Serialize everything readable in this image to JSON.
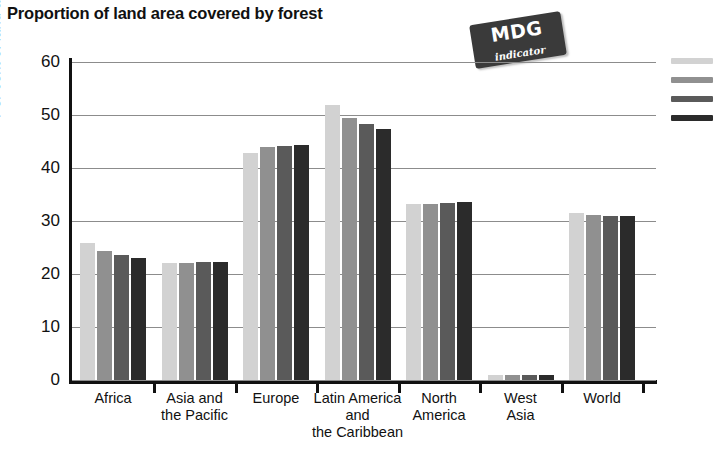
{
  "title": "Proportion of land area covered by forest",
  "badge": {
    "main": "MDG",
    "sub": "indicator"
  },
  "chart_data": {
    "type": "bar",
    "title": "Proportion of land area covered by forest",
    "xlabel": "",
    "ylabel": "Per cent of land area",
    "ylim": [
      0,
      60
    ],
    "yticks": [
      0,
      10,
      20,
      30,
      40,
      50,
      60
    ],
    "grid": true,
    "legend_position": "right",
    "categories": [
      "Africa",
      "Asia and\nthe Pacific",
      "Europe",
      "Latin America\nand\nthe Caribbean",
      "North\nAmerica",
      "West\nAsia",
      "World"
    ],
    "series": [
      {
        "name": "series-1",
        "color": "#d2d2d2",
        "values": [
          25.8,
          22.0,
          42.8,
          51.8,
          33.3,
          1.0,
          31.6
        ]
      },
      {
        "name": "series-2",
        "color": "#909090",
        "values": [
          24.3,
          22.0,
          44.0,
          49.5,
          33.3,
          1.0,
          31.1
        ]
      },
      {
        "name": "series-3",
        "color": "#5a5a5a",
        "values": [
          23.6,
          22.2,
          44.2,
          48.3,
          33.4,
          1.0,
          31.0
        ]
      },
      {
        "name": "series-4",
        "color": "#2b2b2b",
        "values": [
          23.1,
          22.3,
          44.4,
          47.3,
          33.6,
          1.0,
          30.9
        ]
      }
    ]
  },
  "legend_swatches": [
    {
      "color": "#d2d2d2"
    },
    {
      "color": "#909090"
    },
    {
      "color": "#5a5a5a"
    },
    {
      "color": "#2b2b2b"
    }
  ],
  "ytick_labels": [
    "60",
    "50",
    "40",
    "30",
    "20",
    "10",
    "0"
  ]
}
